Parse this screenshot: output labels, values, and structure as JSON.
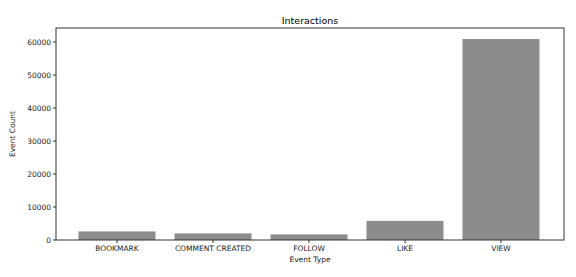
{
  "chart_data": {
    "type": "bar",
    "title": "Interactions",
    "xlabel": "Event Type",
    "ylabel": "Event Count",
    "categories": [
      "BOOKMARK",
      "COMMENT CREATED",
      "FOLLOW",
      "LIKE",
      "VIEW"
    ],
    "values": [
      2600,
      2000,
      1700,
      5800,
      60900
    ],
    "yticks": [
      0,
      10000,
      20000,
      30000,
      40000,
      50000,
      60000
    ],
    "ylim": [
      0,
      64000
    ],
    "grid": false,
    "legend": null,
    "bar_color": "#8c8c8c"
  }
}
